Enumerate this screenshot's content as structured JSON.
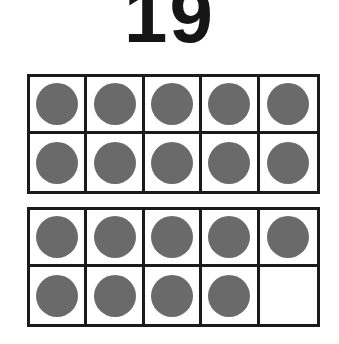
{
  "title": "19",
  "number_label": "19",
  "total_counters": 19,
  "colors": {
    "background": "#ffffff",
    "line": "#1b1b1b",
    "counter_fill": "#6a6a6a",
    "digit": "#151515"
  },
  "frames": [
    {
      "name": "ten-frame-1",
      "filled_count": 10,
      "capacity": 10,
      "cells": [
        {
          "filled": true
        },
        {
          "filled": true
        },
        {
          "filled": true
        },
        {
          "filled": true
        },
        {
          "filled": true
        },
        {
          "filled": true
        },
        {
          "filled": true
        },
        {
          "filled": true
        },
        {
          "filled": true
        },
        {
          "filled": true
        }
      ]
    },
    {
      "name": "ten-frame-2",
      "filled_count": 9,
      "capacity": 10,
      "cells": [
        {
          "filled": true
        },
        {
          "filled": true
        },
        {
          "filled": true
        },
        {
          "filled": true
        },
        {
          "filled": true
        },
        {
          "filled": true
        },
        {
          "filled": true
        },
        {
          "filled": true
        },
        {
          "filled": true
        },
        {
          "filled": false
        }
      ]
    }
  ]
}
